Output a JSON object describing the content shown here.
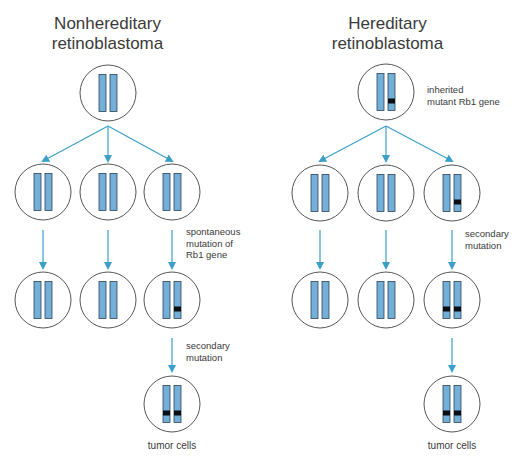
{
  "colors": {
    "arrow": "#3ba0c8",
    "chromosome_fill": "#74afd8",
    "chromosome_stroke": "#2e4457",
    "mutation": "#0a0f14",
    "cell_outline": "#555555"
  },
  "left_panel": {
    "title_line1": "Nonhereditary",
    "title_line2": "retinoblastoma",
    "labels": {
      "spontaneous": "spontaneous\nmutation of\nRb1 gene",
      "secondary": "secondary\nmutation",
      "tumor": "tumor cells"
    }
  },
  "right_panel": {
    "title_line1": "Hereditary",
    "title_line2": "retinoblastoma",
    "labels": {
      "inherited": "inherited\nmutant Rb1 gene",
      "secondary": "secondary\nmutation",
      "tumor": "tumor cells"
    }
  },
  "cells": [
    {
      "id": "L-top",
      "cx": 108,
      "cy": 93,
      "mut": [
        false,
        false
      ]
    },
    {
      "id": "L-r2-1",
      "cx": 43,
      "cy": 192,
      "mut": [
        false,
        false
      ]
    },
    {
      "id": "L-r2-2",
      "cx": 108,
      "cy": 192,
      "mut": [
        false,
        false
      ]
    },
    {
      "id": "L-r2-3",
      "cx": 172,
      "cy": 192,
      "mut": [
        false,
        false
      ]
    },
    {
      "id": "L-r3-1",
      "cx": 43,
      "cy": 300,
      "mut": [
        false,
        false
      ]
    },
    {
      "id": "L-r3-2",
      "cx": 108,
      "cy": 300,
      "mut": [
        false,
        false
      ]
    },
    {
      "id": "L-r3-3",
      "cx": 172,
      "cy": 300,
      "mut": [
        false,
        true
      ]
    },
    {
      "id": "L-tumor",
      "cx": 172,
      "cy": 404,
      "mut": [
        true,
        true
      ]
    },
    {
      "id": "R-top",
      "cx": 386,
      "cy": 92,
      "mut": [
        false,
        true
      ]
    },
    {
      "id": "R-r2-1",
      "cx": 320,
      "cy": 193,
      "mut": [
        false,
        false
      ]
    },
    {
      "id": "R-r2-2",
      "cx": 386,
      "cy": 193,
      "mut": [
        false,
        false
      ]
    },
    {
      "id": "R-r2-3",
      "cx": 452,
      "cy": 193,
      "mut": [
        false,
        true
      ]
    },
    {
      "id": "R-r3-1",
      "cx": 320,
      "cy": 300,
      "mut": [
        false,
        false
      ]
    },
    {
      "id": "R-r3-2",
      "cx": 386,
      "cy": 300,
      "mut": [
        false,
        false
      ]
    },
    {
      "id": "R-r3-3",
      "cx": 452,
      "cy": 300,
      "mut": [
        true,
        true
      ]
    },
    {
      "id": "R-tumor",
      "cx": 452,
      "cy": 404,
      "mut": [
        true,
        true
      ]
    }
  ],
  "arrows": [
    {
      "x1": 108,
      "y1": 126,
      "x2": 43,
      "y2": 161
    },
    {
      "x1": 108,
      "y1": 126,
      "x2": 108,
      "y2": 161
    },
    {
      "x1": 108,
      "y1": 126,
      "x2": 172,
      "y2": 161
    },
    {
      "x1": 43,
      "y1": 230,
      "x2": 43,
      "y2": 268
    },
    {
      "x1": 108,
      "y1": 230,
      "x2": 108,
      "y2": 268
    },
    {
      "x1": 172,
      "y1": 230,
      "x2": 172,
      "y2": 268
    },
    {
      "x1": 172,
      "y1": 338,
      "x2": 172,
      "y2": 371
    },
    {
      "x1": 386,
      "y1": 126,
      "x2": 320,
      "y2": 161
    },
    {
      "x1": 386,
      "y1": 126,
      "x2": 386,
      "y2": 161
    },
    {
      "x1": 386,
      "y1": 126,
      "x2": 452,
      "y2": 161
    },
    {
      "x1": 320,
      "y1": 230,
      "x2": 320,
      "y2": 268
    },
    {
      "x1": 386,
      "y1": 230,
      "x2": 386,
      "y2": 268
    },
    {
      "x1": 452,
      "y1": 230,
      "x2": 452,
      "y2": 268
    },
    {
      "x1": 452,
      "y1": 338,
      "x2": 452,
      "y2": 371
    }
  ]
}
